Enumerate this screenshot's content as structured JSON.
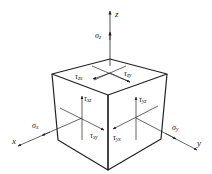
{
  "figure": {
    "colors": {
      "stroke": "#222222",
      "background": "#ffffff"
    }
  },
  "axes": {
    "x": {
      "label": "x"
    },
    "y": {
      "label": "y"
    },
    "z": {
      "label": "z"
    }
  },
  "normal_stresses": {
    "sigma_x": {
      "symbol": "σ",
      "sub": "x"
    },
    "sigma_y": {
      "symbol": "σ",
      "sub": "y"
    },
    "sigma_z": {
      "symbol": "σ",
      "sub": "z"
    }
  },
  "shear_stresses": {
    "tau_zx": {
      "symbol": "τ",
      "sub": "zx"
    },
    "tau_zy": {
      "symbol": "τ",
      "sub": "zy"
    },
    "tau_xz": {
      "symbol": "τ",
      "sub": "xz"
    },
    "tau_xy": {
      "symbol": "τ",
      "sub": "xy"
    },
    "tau_yz": {
      "symbol": "τ",
      "sub": "yz"
    },
    "tau_yx": {
      "symbol": "τ",
      "sub": "yx"
    }
  }
}
